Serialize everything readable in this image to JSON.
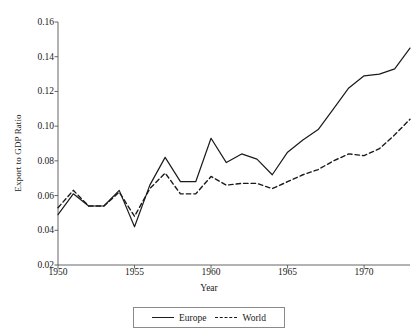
{
  "chart_data": {
    "type": "line",
    "title": "",
    "xlabel": "Year",
    "ylabel": "Export to GDP Ratio",
    "xlim": [
      1950,
      1973
    ],
    "ylim": [
      0.02,
      0.16
    ],
    "xticks": [
      1950,
      1955,
      1960,
      1965,
      1970
    ],
    "xtick_labels": [
      "1950",
      "1955",
      "1960",
      "1965",
      "1970"
    ],
    "yticks": [
      0.02,
      0.04,
      0.06,
      0.08,
      0.1,
      0.12,
      0.14,
      0.16
    ],
    "ytick_labels": [
      "0.02",
      "0.04",
      "0.06",
      "0.08",
      "0.10",
      "0.12",
      "0.14",
      "0.16"
    ],
    "grid": false,
    "legend_position": "bottom-center",
    "x": [
      1950,
      1951,
      1952,
      1953,
      1954,
      1955,
      1956,
      1957,
      1958,
      1959,
      1960,
      1961,
      1962,
      1963,
      1964,
      1965,
      1966,
      1967,
      1968,
      1969,
      1970,
      1971,
      1972,
      1973
    ],
    "series": [
      {
        "name": "Europe",
        "style": "solid",
        "color": "#1a1a1a",
        "values": [
          0.049,
          0.061,
          0.054,
          0.054,
          0.063,
          0.042,
          0.066,
          0.082,
          0.068,
          0.068,
          0.093,
          0.079,
          0.084,
          0.081,
          0.072,
          0.085,
          0.092,
          0.098,
          0.11,
          0.122,
          0.129,
          0.13,
          0.133,
          0.145
        ]
      },
      {
        "name": "World",
        "style": "dashed",
        "color": "#1a1a1a",
        "values": [
          0.053,
          0.063,
          0.054,
          0.054,
          0.062,
          0.048,
          0.064,
          0.073,
          0.061,
          0.061,
          0.071,
          0.066,
          0.067,
          0.067,
          0.064,
          0.068,
          0.072,
          0.075,
          0.08,
          0.084,
          0.083,
          0.087,
          0.095,
          0.104
        ]
      }
    ]
  },
  "legend": {
    "items": [
      {
        "label": "Europe",
        "style": "solid"
      },
      {
        "label": "World",
        "style": "dashed"
      }
    ]
  }
}
